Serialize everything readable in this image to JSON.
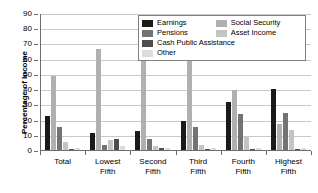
{
  "chart_data": {
    "type": "bar",
    "title": "",
    "xlabel": "",
    "ylabel": "Percentage of Income",
    "ylim": [
      0,
      90
    ],
    "yticks": [
      90,
      80,
      70,
      60,
      50,
      40,
      30,
      20,
      10,
      0
    ],
    "grid": true,
    "legend_position": "top-right-inside",
    "categories": [
      "Total",
      "Lowest Fifth",
      "Second Fifth",
      "Third Fifth",
      "Fourth Fifth",
      "Highest Fifth"
    ],
    "category_lines": [
      [
        "Total"
      ],
      [
        "Lowest",
        "Fifth"
      ],
      [
        "Second",
        "Fifth"
      ],
      [
        "Third",
        "Fifth"
      ],
      [
        "Fourth",
        "Fifth"
      ],
      [
        "Highest",
        "Fifth"
      ]
    ],
    "series": [
      {
        "name": "Earnings",
        "color": "#1a1a1a",
        "values": [
          23,
          12,
          13,
          20,
          32,
          41
        ]
      },
      {
        "name": "Social Security",
        "color": "#b0b0b0",
        "values": [
          49,
          67,
          72,
          59,
          40,
          18
        ]
      },
      {
        "name": "Pensions",
        "color": "#737373",
        "values": [
          16,
          4,
          8,
          16,
          24,
          25
        ]
      },
      {
        "name": "Asset Income",
        "color": "#c4c4c4",
        "values": [
          6,
          7,
          3,
          4,
          9,
          14
        ]
      },
      {
        "name": "Cash Public Assistance",
        "color": "#4d4d4d",
        "values": [
          1,
          8,
          2,
          1,
          1,
          1
        ]
      },
      {
        "name": "Other",
        "color": "#dcdcdc",
        "values": [
          2,
          3,
          2,
          2,
          2,
          2
        ]
      }
    ],
    "legend_entries": [
      {
        "label": "Earnings",
        "color": "#1a1a1a"
      },
      {
        "label": "Social Security",
        "color": "#b0b0b0"
      },
      {
        "label": "Pensions",
        "color": "#737373"
      },
      {
        "label": "Asset Income",
        "color": "#c4c4c4"
      },
      {
        "label": "Cash Public Assistance",
        "color": "#4d4d4d"
      },
      {
        "label": "Other",
        "color": "#dcdcdc"
      }
    ]
  }
}
